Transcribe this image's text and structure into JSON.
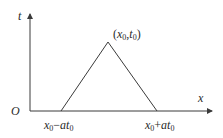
{
  "diagram": {
    "type": "characteristic-triangle",
    "axes": {
      "vertical_label": "t",
      "horizontal_label": "x",
      "origin_label": "O"
    },
    "apex_label": {
      "open": "(",
      "var1": "x",
      "sub1": "0",
      "sep": ",",
      "var2": "t",
      "sub2": "0",
      "close": ")"
    },
    "left_base_label": {
      "var1": "x",
      "sub1": "0",
      "op": "−",
      "var2": "at",
      "sub2": "0"
    },
    "right_base_label": {
      "var1": "x",
      "sub1": "0",
      "op": "+",
      "var2": "at",
      "sub2": "0"
    },
    "colors": {
      "line": "#3a3a3a",
      "text": "#2a2a2a",
      "background": "#ffffff"
    }
  }
}
